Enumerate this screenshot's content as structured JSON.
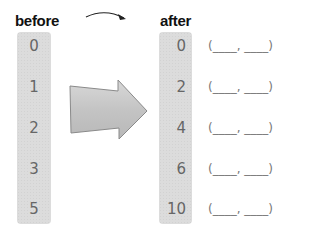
{
  "before": {
    "label": "before",
    "values": [
      "0",
      "1",
      "2",
      "3",
      "5"
    ]
  },
  "after": {
    "label": "after",
    "values": [
      "0",
      "2",
      "4",
      "6",
      "10"
    ]
  },
  "blanks": [
    "(____, ____)",
    "(____, ____)",
    "(____, ____)",
    "(____, ____)",
    "(____, ____)"
  ],
  "colors": {
    "column_fill": "#dcdcdc",
    "arrow_fill": "#c8c8c8",
    "arrow_stroke": "#8a8a8a",
    "text": "#666666"
  }
}
